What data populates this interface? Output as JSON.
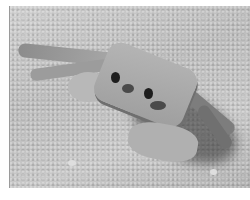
{
  "image": {
    "subject": "ghost crab on sand",
    "colorMode": "grayscale",
    "colors": {
      "background": "#ffffff",
      "sand": "#c4c4c4",
      "crab": "#a8a8a8",
      "eyes": "#1e1e1e",
      "shadow": "#3a3a3a"
    }
  }
}
